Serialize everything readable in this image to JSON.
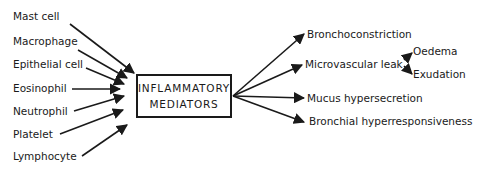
{
  "diagram": {
    "center": {
      "line1": "INFLAMMATORY",
      "line2": "MEDIATORS"
    },
    "sources": [
      {
        "label": "Mast cell"
      },
      {
        "label": "Macrophage"
      },
      {
        "label": "Epithelial cell"
      },
      {
        "label": "Eosinophil"
      },
      {
        "label": "Neutrophil"
      },
      {
        "label": "Platelet"
      },
      {
        "label": "Lymphocyte"
      }
    ],
    "effects": [
      {
        "label": "Bronchoconstriction"
      },
      {
        "label": "Microvascular leak"
      },
      {
        "label": "Mucus hypersecretion"
      },
      {
        "label": "Bronchial hyperresponsiveness"
      }
    ],
    "sub_effects": [
      {
        "label": "Oedema"
      },
      {
        "label": "Exudation"
      }
    ],
    "colors": {
      "ink": "#1a1a1a",
      "background": "#ffffff"
    }
  }
}
